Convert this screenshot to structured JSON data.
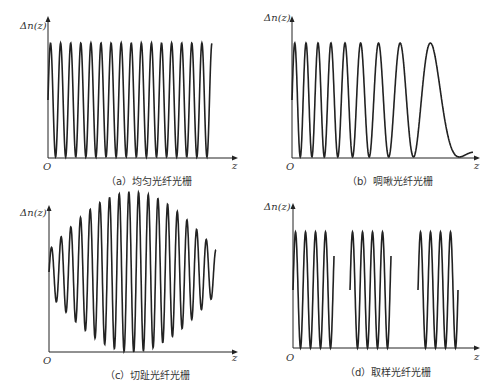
{
  "figure": {
    "panels": [
      {
        "id": "a",
        "caption": "（a）均匀光纤光栅",
        "ylabel": "Δn(z)",
        "xlabel": "z",
        "origin": "O"
      },
      {
        "id": "b",
        "caption": "（b）啁啾光纤光栅",
        "ylabel": "Δn(z)",
        "xlabel": "z",
        "origin": "O"
      },
      {
        "id": "c",
        "caption": "（c）切趾光纤光栅",
        "ylabel": "Δn(z)",
        "xlabel": "z",
        "origin": "O"
      },
      {
        "id": "d",
        "caption": "（d）取样光纤光栅",
        "ylabel": "Δn(z)",
        "xlabel": "z",
        "origin": "O"
      }
    ],
    "stroke_color": "#222222"
  }
}
